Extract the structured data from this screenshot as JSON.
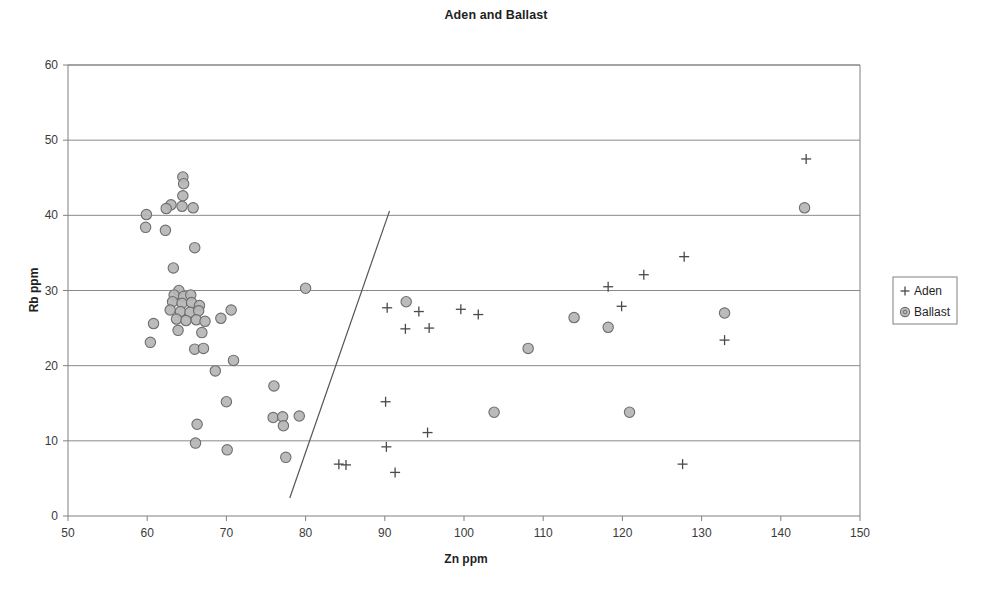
{
  "chart_data": {
    "type": "scatter",
    "title": "Aden and Ballast",
    "xlabel": "Zn ppm",
    "ylabel": "Rb ppm",
    "xlim": [
      50,
      150
    ],
    "ylim": [
      0,
      60
    ],
    "xticks": [
      50,
      60,
      70,
      80,
      90,
      100,
      110,
      120,
      130,
      140,
      150
    ],
    "yticks": [
      0,
      10,
      20,
      30,
      40,
      50,
      60
    ],
    "grid": "horizontal",
    "legend_position": "right",
    "series": [
      {
        "name": "Aden",
        "marker": "plus",
        "color": "#4a4a4a",
        "points": [
          [
            90.3,
            27.7
          ],
          [
            92.6,
            24.9
          ],
          [
            94.3,
            27.2
          ],
          [
            95.6,
            25.0
          ],
          [
            99.6,
            27.5
          ],
          [
            101.8,
            26.8
          ],
          [
            118.2,
            30.5
          ],
          [
            119.9,
            27.9
          ],
          [
            122.7,
            32.1
          ],
          [
            127.8,
            34.5
          ],
          [
            132.9,
            23.4
          ],
          [
            143.2,
            47.5
          ],
          [
            90.1,
            15.2
          ],
          [
            95.4,
            11.1
          ],
          [
            90.2,
            9.2
          ],
          [
            84.2,
            6.9
          ],
          [
            85.1,
            6.8
          ],
          [
            91.3,
            5.8
          ],
          [
            127.6,
            6.9
          ]
        ]
      },
      {
        "name": "Ballast",
        "marker": "circle",
        "color": "#b5b5b5",
        "points": [
          [
            64.5,
            45.1
          ],
          [
            64.6,
            44.2
          ],
          [
            64.5,
            42.6
          ],
          [
            63.0,
            41.4
          ],
          [
            64.4,
            41.2
          ],
          [
            65.8,
            41.0
          ],
          [
            62.4,
            40.9
          ],
          [
            59.9,
            40.1
          ],
          [
            59.8,
            38.4
          ],
          [
            62.3,
            38.0
          ],
          [
            66.0,
            35.7
          ],
          [
            63.3,
            33.0
          ],
          [
            64.0,
            30.0
          ],
          [
            80.0,
            30.3
          ],
          [
            63.4,
            29.4
          ],
          [
            64.6,
            29.2
          ],
          [
            65.5,
            29.4
          ],
          [
            63.2,
            28.5
          ],
          [
            64.4,
            28.3
          ],
          [
            65.6,
            28.4
          ],
          [
            66.6,
            28.0
          ],
          [
            62.9,
            27.4
          ],
          [
            64.2,
            27.2
          ],
          [
            65.4,
            27.1
          ],
          [
            66.5,
            27.3
          ],
          [
            70.6,
            27.4
          ],
          [
            63.7,
            26.2
          ],
          [
            64.9,
            26.0
          ],
          [
            66.2,
            26.1
          ],
          [
            67.3,
            25.9
          ],
          [
            60.8,
            25.6
          ],
          [
            69.3,
            26.3
          ],
          [
            92.7,
            28.5
          ],
          [
            113.9,
            26.4
          ],
          [
            118.2,
            25.1
          ],
          [
            132.9,
            27.0
          ],
          [
            143.0,
            41.0
          ],
          [
            63.9,
            24.7
          ],
          [
            66.9,
            24.4
          ],
          [
            60.4,
            23.1
          ],
          [
            66.0,
            22.2
          ],
          [
            67.1,
            22.3
          ],
          [
            108.1,
            22.3
          ],
          [
            70.9,
            20.7
          ],
          [
            68.6,
            19.3
          ],
          [
            76.0,
            17.3
          ],
          [
            70.0,
            15.2
          ],
          [
            75.9,
            13.1
          ],
          [
            77.1,
            13.2
          ],
          [
            79.2,
            13.3
          ],
          [
            77.2,
            12.0
          ],
          [
            66.3,
            12.2
          ],
          [
            103.8,
            13.8
          ],
          [
            120.9,
            13.8
          ],
          [
            66.1,
            9.7
          ],
          [
            70.1,
            8.8
          ],
          [
            77.5,
            7.8
          ]
        ]
      }
    ],
    "trend_line": {
      "x1": 78.0,
      "y1": 2.4,
      "x2": 90.6,
      "y2": 40.6
    }
  },
  "legend": {
    "entries": [
      {
        "symbol": "+",
        "label": "Aden"
      },
      {
        "symbol": "◎",
        "label": "Ballast"
      }
    ]
  }
}
